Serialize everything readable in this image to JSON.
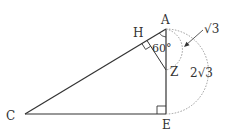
{
  "diagram": {
    "type": "geometry",
    "points": {
      "A": {
        "label": "A",
        "x": 166,
        "y": 29
      },
      "H": {
        "label": "H",
        "x": 147,
        "y": 40
      },
      "Z": {
        "label": "Z",
        "x": 166,
        "y": 70
      },
      "C": {
        "label": "C",
        "x": 25,
        "y": 114
      },
      "E": {
        "label": "E",
        "x": 166,
        "y": 114
      }
    },
    "segments": [
      [
        "A",
        "C"
      ],
      [
        "C",
        "E"
      ],
      [
        "A",
        "E"
      ],
      [
        "H",
        "Z"
      ]
    ],
    "right_angles": [
      "H",
      "E"
    ],
    "angle_label": "60°",
    "arc_small_label": "√3",
    "arc_large_label": "2√3",
    "colors": {
      "line": "#333333",
      "dotted": "#9a9a9a",
      "text": "#333333"
    }
  }
}
